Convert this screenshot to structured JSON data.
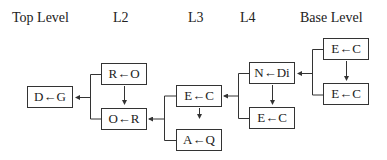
{
  "headers": {
    "top": "Top Level",
    "l2": "L2",
    "l3": "L3",
    "l4": "L4",
    "base": "Base Level"
  },
  "nodes": {
    "top": "D←G",
    "l2_upper": "R←O",
    "l2_lower": "O←R",
    "l3_upper": "E←C",
    "l3_lower": "A←Q",
    "l4_upper": "N←Di",
    "l4_lower": "E←C",
    "base_upper": "E←C",
    "base_lower": "E←C"
  },
  "colors": {
    "line": "#333333",
    "text": "#222222",
    "background": "#ffffff"
  }
}
